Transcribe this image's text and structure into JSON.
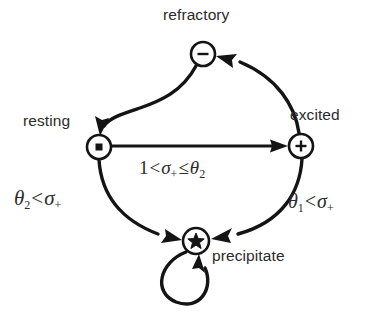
{
  "diagram": {
    "type": "state-transition-diagram",
    "background_color": "#ffffff",
    "stroke_color": "#141414",
    "text_color": "#2b2b2b",
    "nodes": [
      {
        "id": "refractory",
        "label": "refractory",
        "glyph": "minus",
        "glyph_name": "minus-icon",
        "cx": 203,
        "cy": 54,
        "r": 12
      },
      {
        "id": "resting",
        "label": "resting",
        "glyph": "dot",
        "glyph_name": "dot-icon",
        "cx": 99,
        "cy": 147,
        "r": 12
      },
      {
        "id": "excited",
        "label": "excited",
        "glyph": "plus",
        "glyph_name": "plus-icon",
        "cx": 301,
        "cy": 146,
        "r": 12
      },
      {
        "id": "precipitate",
        "label": "precipitate",
        "glyph": "star",
        "glyph_name": "star-icon",
        "cx": 196,
        "cy": 241,
        "r": 13
      }
    ],
    "edges": [
      {
        "id": "resting-to-excited",
        "from": "resting",
        "to": "excited",
        "label_parts": {
          "lhs": "1",
          "relation_1": "<",
          "symbol": "σ",
          "symbol_sub": "+",
          "relation_2": "≤",
          "rhs": "θ",
          "rhs_sub": "2"
        },
        "label_text": "1 < σ+ ≤ θ2",
        "shape": "straight"
      },
      {
        "id": "excited-to-refractory",
        "from": "excited",
        "to": "refractory",
        "label_text": "",
        "shape": "curve"
      },
      {
        "id": "refractory-to-resting",
        "from": "refractory",
        "to": "resting",
        "label_text": "",
        "shape": "s-curve"
      },
      {
        "id": "resting-to-precipitate",
        "from": "resting",
        "to": "precipitate",
        "label_parts": {
          "lhs": "θ",
          "lhs_sub": "2",
          "relation_1": "<",
          "symbol": "σ",
          "symbol_sub": "+"
        },
        "label_text": "θ2 < σ+",
        "shape": "curve"
      },
      {
        "id": "excited-to-precipitate",
        "from": "excited",
        "to": "precipitate",
        "label_parts": {
          "lhs": "θ",
          "lhs_sub": "1",
          "relation_1": "<",
          "symbol": "σ",
          "symbol_sub": "+"
        },
        "label_text": "θ1 < σ+",
        "shape": "curve"
      },
      {
        "id": "precipitate-self-loop",
        "from": "precipitate",
        "to": "precipitate",
        "label_text": "",
        "shape": "self-loop"
      }
    ]
  }
}
